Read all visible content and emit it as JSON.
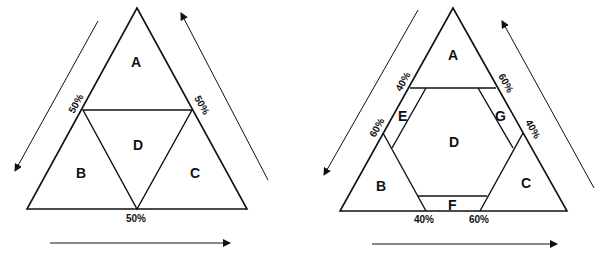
{
  "diagrams": [
    {
      "name": "left-ternary-diagram",
      "regions": {
        "A": "A",
        "B": "B",
        "C": "C",
        "D": "D"
      },
      "edge_labels": {
        "left": "50%",
        "right": "50%",
        "bottom": "50%"
      }
    },
    {
      "name": "right-ternary-diagram",
      "regions": {
        "A": "A",
        "B": "B",
        "C": "C",
        "D": "D",
        "E": "E",
        "F": "F",
        "G": "G"
      },
      "edge_labels": {
        "left_upper": "40%",
        "left_lower": "60%",
        "right_upper": "60%",
        "right_lower": "40%",
        "bottom_left": "40%",
        "bottom_right": "60%"
      }
    }
  ],
  "colors": {
    "ink": "#111111",
    "background": "#ffffff"
  }
}
